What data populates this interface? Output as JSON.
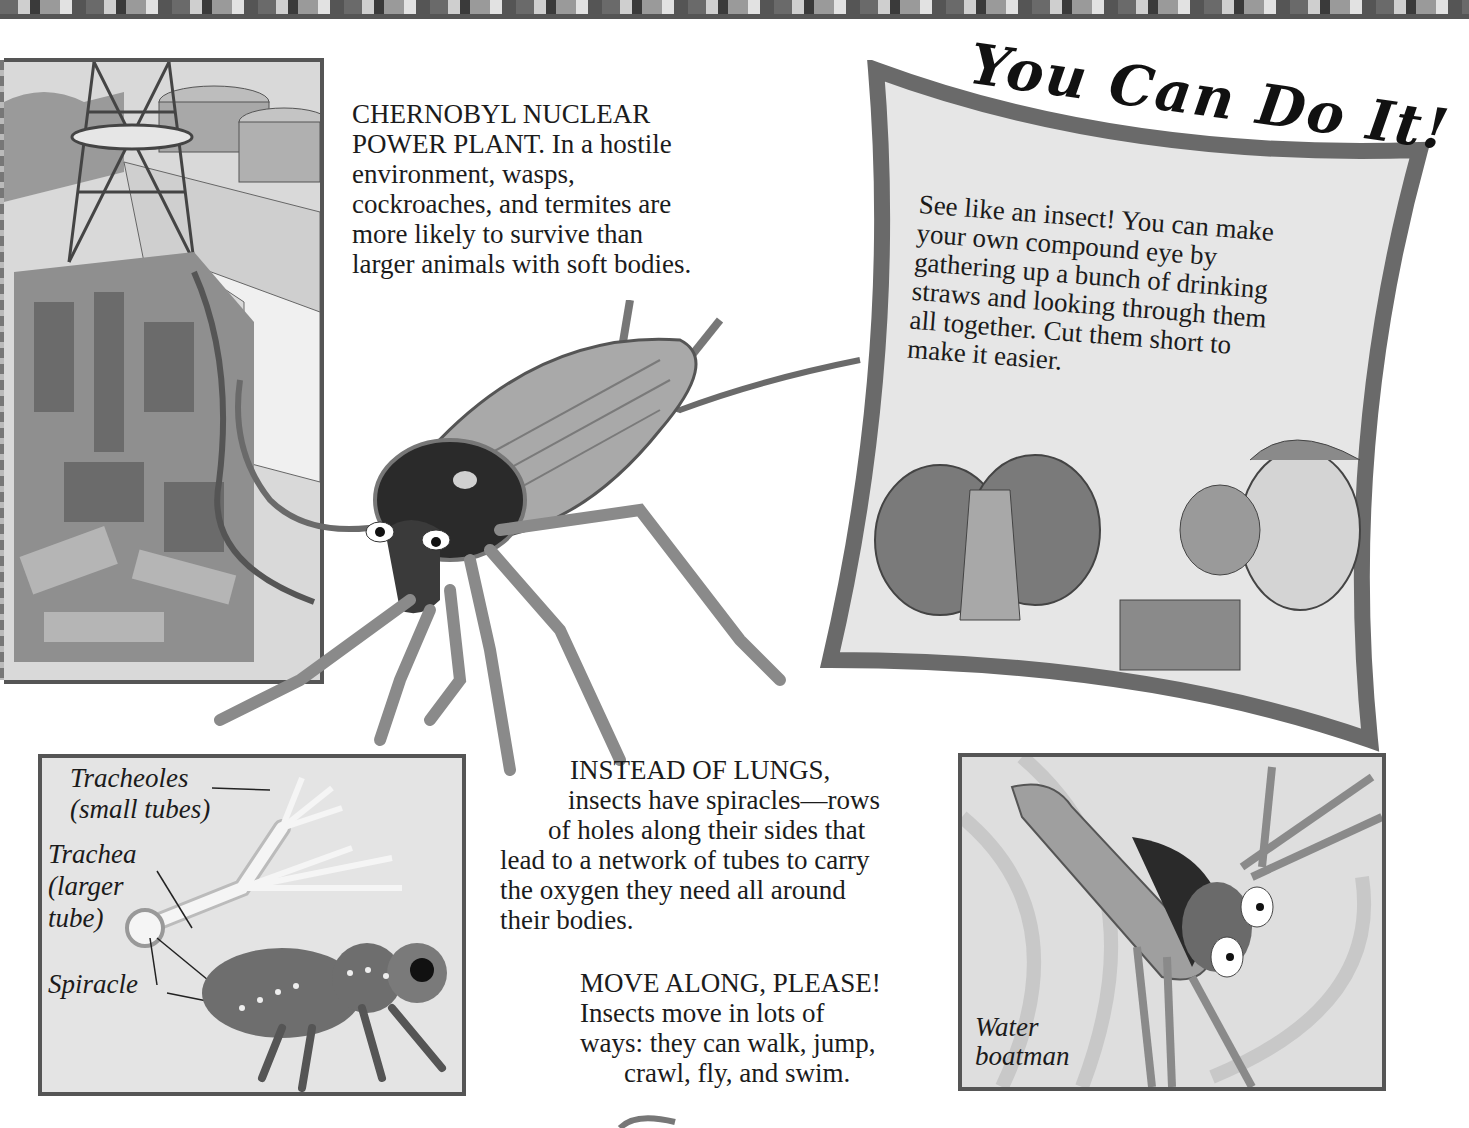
{
  "page": {
    "type": "book spread (educational, insects)",
    "palette": {
      "background": "#ffffff",
      "frame_border": "#555555",
      "panel_fill": "#e0e0e0",
      "text": "#1b1b1b"
    }
  },
  "chernobyl": {
    "illustration": "Chernobyl nuclear power plant cutaway with ventilation tower",
    "caption": {
      "lines": [
        "CHERNOBYL NUCLEAR",
        "POWER PLANT. In a hostile",
        "environment, wasps,",
        "cockroaches, and termites are",
        "more likely to survive than",
        "larger animals with soft bodies."
      ]
    }
  },
  "cockroach": {
    "illustration": "Large cockroach with long antennae"
  },
  "you_can_do_it": {
    "title": "You Can Do It!",
    "lines": [
      "See like an insect! You can make",
      "your own compound eye by",
      "gathering up a bunch of drinking",
      "straws and looking through them",
      "all together. Cut them short to",
      "make it easier."
    ],
    "illustrations": [
      "fly head with compound eyes",
      "boy looking through bundle of straws"
    ]
  },
  "spiracle_diagram": {
    "labels": {
      "tracheoles": "Tracheoles",
      "tracheoles_sub": "(small tubes)",
      "trachea": "Trachea",
      "trachea_sub1": "(larger",
      "trachea_sub2": "tube)",
      "spiracle": "Spiracle"
    }
  },
  "lungs": {
    "lines": [
      "INSTEAD OF LUNGS,",
      "insects have spiracles—rows",
      "of holes along their sides that",
      "lead to a network of tubes to carry",
      "the oxygen they need all around",
      "their bodies."
    ]
  },
  "move_along": {
    "lines": [
      "MOVE ALONG, PLEASE!",
      "Insects move in lots of",
      "ways: they can walk, jump,",
      "crawl, fly, and swim."
    ]
  },
  "water_boatman": {
    "label_line1": "Water",
    "label_line2": "boatman"
  }
}
